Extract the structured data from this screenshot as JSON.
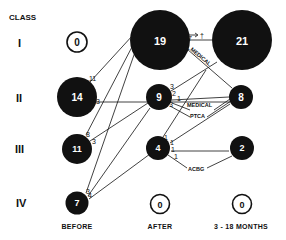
{
  "title": "CLASS",
  "rows": [
    {
      "label": "I"
    },
    {
      "label": "II"
    },
    {
      "label": "III"
    },
    {
      "label": "IV"
    }
  ],
  "columns": [
    {
      "label": "BEFORE"
    },
    {
      "label": "AFTER"
    },
    {
      "label": "3 - 18 MONTHS"
    }
  ],
  "nodes": {
    "before": [
      "0",
      "14",
      "11",
      "7"
    ],
    "after": [
      "19",
      "9",
      "4",
      "0"
    ],
    "followup": [
      "21",
      "8",
      "2",
      "0"
    ]
  },
  "flow_labels": {
    "b2_up": "11",
    "b2_right": "3",
    "b3_up": "8",
    "b3_right": "3",
    "b4_a": "3",
    "b4_b": "4",
    "a1_death": "1",
    "death_symbol": "†",
    "a1_right": "17",
    "a1_down": "1",
    "a2_up": "3",
    "a2_right": "2",
    "a2_mid": "1",
    "a2_down": "3",
    "a3_up": "1",
    "a3_right1": "1",
    "a3_right2": "1",
    "a3_low": "1",
    "a3_small": "1"
  },
  "annotations": {
    "medical_top": "MEDICAL",
    "medical_mid": "MEDICAL",
    "ptca": "PTCA",
    "acbg": "ACBG"
  }
}
